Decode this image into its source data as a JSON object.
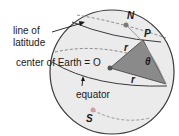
{
  "diagram": {
    "labels": {
      "line_of_latitude_1": "line of",
      "line_of_latitude_2": "latitude",
      "center": "center of Earth = O",
      "equator": "equator",
      "north": "N",
      "south": "S",
      "point_p": "P",
      "radius_top": "r",
      "radius_bottom": "r",
      "angle": "θ"
    },
    "colors": {
      "sphere_fill": "#ebebeb",
      "sector_fill": "#8a8a8a",
      "outline": "#3a3a3a",
      "dashed": "#888888",
      "point": "#7a7a7a",
      "south_point": "#d0a0a0"
    }
  }
}
